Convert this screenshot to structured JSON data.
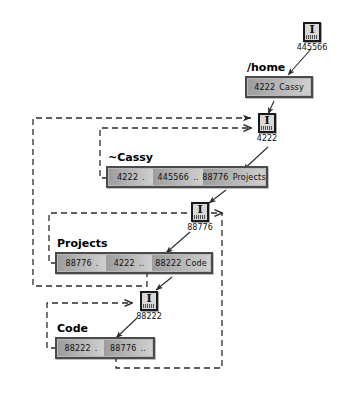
{
  "diagram": {
    "colors": {
      "line": "#2b2b2b",
      "box_border": "#4a4a4a",
      "cell_dark": "#9d9d9d",
      "cell_light": "#cfcfcf",
      "icon_border": "#1a1a1a",
      "icon_fill": "#d8d8d8",
      "background": "#ffffff"
    },
    "icon_name": "inode-icon",
    "inodes": [
      {
        "id": "root",
        "number": "445566"
      },
      {
        "id": "home",
        "number": "4222"
      },
      {
        "id": "cassy",
        "number": "88776"
      },
      {
        "id": "projects",
        "number": "88222"
      }
    ],
    "directories": [
      {
        "id": "home",
        "caption": "/home",
        "entries": [
          {
            "inode": "4222",
            "name": "Cassy"
          }
        ]
      },
      {
        "id": "cassy",
        "caption": "~Cassy",
        "entries": [
          {
            "inode": "4222",
            "name": "."
          },
          {
            "inode": "445566",
            "name": ".."
          },
          {
            "inode": "88776",
            "name": "Projects"
          }
        ]
      },
      {
        "id": "projects",
        "caption": "Projects",
        "entries": [
          {
            "inode": "88776",
            "name": "."
          },
          {
            "inode": "4222",
            "name": ".."
          },
          {
            "inode": "88222",
            "name": "Code"
          }
        ]
      },
      {
        "id": "code",
        "caption": "Code",
        "entries": [
          {
            "inode": "88222",
            "name": "."
          },
          {
            "inode": "88776",
            "name": ".."
          }
        ]
      }
    ]
  }
}
